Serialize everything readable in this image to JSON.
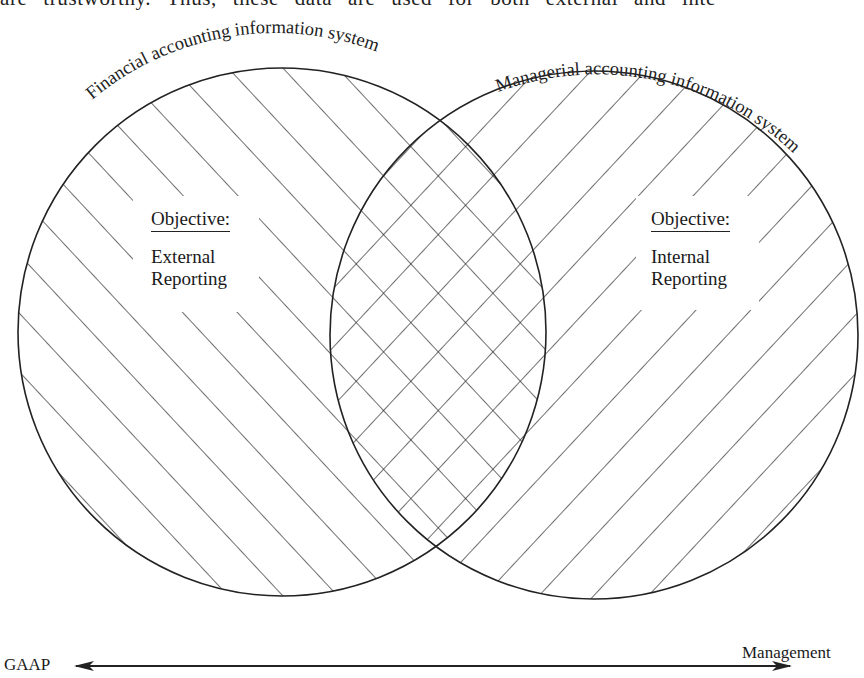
{
  "top_text": "are trustworthy. Thus, these data are used for both external and inte",
  "circles": {
    "left": {
      "title": "Financial accounting information system",
      "objective_heading": "Objective:",
      "objective_line1": "External",
      "objective_line2": "Reporting",
      "hatch": "back-slash diagonal"
    },
    "right": {
      "title": "Managerial accounting information system",
      "objective_heading": "Objective:",
      "objective_line1": "Internal",
      "objective_line2": "Reporting",
      "hatch": "forward-slash diagonal"
    },
    "overlap": {
      "hatch": "cross-hatch"
    }
  },
  "axis": {
    "left_label": "GAAP",
    "right_label": "Management",
    "style": "double-headed arrow"
  },
  "colors": {
    "ink": "#222222",
    "background": "#ffffff"
  }
}
